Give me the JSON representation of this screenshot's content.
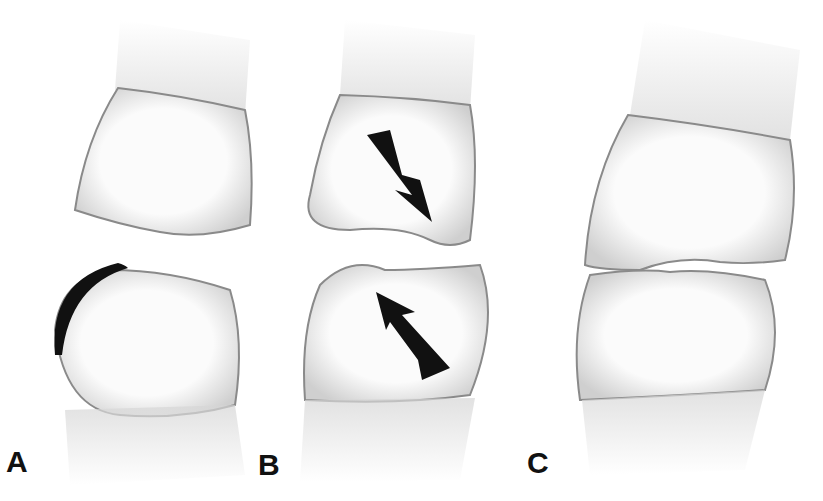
{
  "figure": {
    "panels": [
      {
        "label": "A",
        "annotation": "black crescent on distal-occlusal edge of lower tooth"
      },
      {
        "label": "B",
        "annotation": "opposing arrows indicating tooth movement"
      },
      {
        "label": "C",
        "annotation": "teeth in contact"
      }
    ],
    "colors": {
      "ink": "#111111",
      "tooth_fill": "#f4f4f4",
      "tooth_outline": "#8a8a8a",
      "root": "#d8d8d8"
    }
  }
}
